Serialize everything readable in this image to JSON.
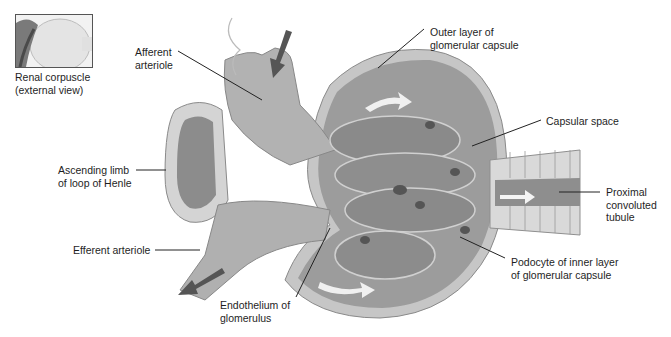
{
  "diagram": {
    "style": "grayscale anatomical illustration",
    "inset": {
      "caption": "Renal corpuscle\n(external view)"
    },
    "labels": {
      "afferent_arteriole": "Afferent\narteriole",
      "outer_layer": "Outer layer of\nglomerular capsule",
      "capsular_space": "Capsular space",
      "ascending_limb": "Ascending limb\nof loop of Henle",
      "proximal_tubule": "Proximal\nconvoluted\ntubule",
      "efferent_arteriole": "Efferent arteriole",
      "podocyte": "Podocyte of inner layer\nof glomerular capsule",
      "endothelium": "Endothelium of\nglomerulus"
    },
    "colors": {
      "capsule_fill": "#9a9a9a",
      "capsule_outer": "#c8c8c8",
      "vessel_fill": "#a8a8a8",
      "tubule_cells": "#d8d8d8",
      "leader_line": "#222222",
      "flow_arrow": "#f2f2f2",
      "blood_arrow": "#555555"
    }
  }
}
